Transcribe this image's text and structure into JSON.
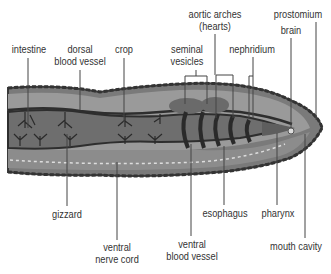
{
  "diagram": {
    "colors": {
      "outline": "#3a3a3a",
      "body_outer": "#7a7a7a",
      "body_mid": "#999999",
      "body_inner": "#8a8a8a",
      "gut": "#6e6e6e",
      "arches": "#2e2e2e",
      "leader_line": "#444444",
      "label_text": "#333333"
    },
    "labels_top": [
      {
        "id": "intestine",
        "lines": [
          "intestine"
        ]
      },
      {
        "id": "dorsal-blood-vessel",
        "lines": [
          "dorsal",
          "blood vessel"
        ]
      },
      {
        "id": "crop",
        "lines": [
          "crop"
        ]
      },
      {
        "id": "seminal-vesicles",
        "lines": [
          "seminal",
          "vesicles"
        ]
      },
      {
        "id": "aortic-arches",
        "lines": [
          "aortic arches",
          "(hearts)"
        ]
      },
      {
        "id": "nephridium",
        "lines": [
          "nephridium"
        ]
      },
      {
        "id": "prostomium",
        "lines": [
          "prostomium"
        ]
      },
      {
        "id": "brain",
        "lines": [
          "brain"
        ]
      }
    ],
    "labels_bottom": [
      {
        "id": "gizzard",
        "lines": [
          "gizzard"
        ]
      },
      {
        "id": "ventral-nerve-cord",
        "lines": [
          "ventral",
          "nerve cord"
        ]
      },
      {
        "id": "ventral-blood-vessel",
        "lines": [
          "ventral",
          "blood vessel"
        ]
      },
      {
        "id": "esophagus",
        "lines": [
          "esophagus"
        ]
      },
      {
        "id": "pharynx",
        "lines": [
          "pharynx"
        ]
      },
      {
        "id": "mouth-cavity",
        "lines": [
          "mouth cavity"
        ]
      }
    ]
  }
}
